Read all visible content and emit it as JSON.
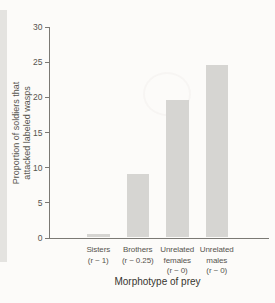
{
  "figure": {
    "background": "#fcfbf9",
    "left_strip_color": "#e4e3e0"
  },
  "chart_data": {
    "type": "bar",
    "title": "",
    "xlabel": "Morphotype of prey",
    "ylabel": "Proportion of soldiers that attacked labeled wasps",
    "ylabel_lines": [
      "Proportion of soldiers that",
      "attacked labeled wasps"
    ],
    "categories": [
      "Sisters (r ~ 1)",
      "Brothers (r ~ 0.25)",
      "Unrelated females (r ~ 0)",
      "Unrelated males (r ~ 0)"
    ],
    "category_label_lines": [
      [
        "Sisters",
        "(r ~ 1)"
      ],
      [
        "Brothers",
        "(r ~ 0.25)"
      ],
      [
        "Unrelated",
        "females",
        "(r ~ 0)"
      ],
      [
        "Unrelated",
        "males",
        "(r ~ 0)"
      ]
    ],
    "category_keys": [
      "sisters",
      "brothers",
      "unrelated-females",
      "unrelated-males"
    ],
    "values": [
      0.5,
      9,
      19.5,
      24.5
    ],
    "ylim": [
      0,
      30
    ],
    "yticks": [
      0,
      5,
      10,
      15,
      20,
      25,
      30
    ],
    "grid": false,
    "legend": "none",
    "bar_color": "#d6d5d2",
    "axis_color": "#7b7974",
    "tick_text_color": "#56544e",
    "label_text_color": "#37352f"
  }
}
